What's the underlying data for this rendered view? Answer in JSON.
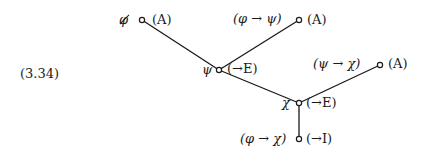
{
  "equation_number": "(3.34)",
  "nodes": [
    {
      "id": "n1",
      "formula": "φ",
      "discharged": true,
      "rule": "(A)",
      "x": 142,
      "y": 20
    },
    {
      "id": "n2",
      "formula": "(φ → ψ)",
      "discharged": false,
      "rule": "(A)",
      "x": 299,
      "y": 20
    },
    {
      "id": "n3",
      "formula": "ψ",
      "discharged": false,
      "rule": "(→E)",
      "x": 219,
      "y": 70
    },
    {
      "id": "n4",
      "formula": "(ψ → χ)",
      "discharged": false,
      "rule": "(A)",
      "x": 380,
      "y": 65
    },
    {
      "id": "n5",
      "formula": "χ",
      "discharged": false,
      "rule": "(→E)",
      "x": 299,
      "y": 103
    },
    {
      "id": "n6",
      "formula": "(φ → χ)",
      "discharged": false,
      "rule": "(→I)",
      "x": 299,
      "y": 139
    }
  ],
  "edges": [
    {
      "from": "n1",
      "to": "n3"
    },
    {
      "from": "n2",
      "to": "n3"
    },
    {
      "from": "n3",
      "to": "n5"
    },
    {
      "from": "n4",
      "to": "n5"
    },
    {
      "from": "n5",
      "to": "n6"
    }
  ],
  "colors": {
    "ink": "#1a1a1a",
    "background": "#ffffff"
  }
}
